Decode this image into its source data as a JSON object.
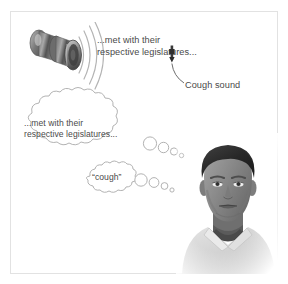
{
  "figure": {
    "background_color": "#ffffff",
    "frame_color": "#e2e2e2",
    "text_color": "#4a4a4a",
    "outline_color": "#b0b0b0"
  },
  "speaker_icon": {
    "name": "loudspeaker-icon",
    "wave_count": 4,
    "body_color": "#7a7a7a",
    "highlight_color": "#cfcfcf",
    "shadow_color": "#4f4f4f"
  },
  "spoken_text": {
    "line1": "...met with their",
    "line2": "respective legislatures..."
  },
  "cough_marker": {
    "label": "Cough sound",
    "marker_color": "#3a3a3a"
  },
  "thought_bubbles": [
    {
      "id": "bubble-speech-thought",
      "line1": "...met with their",
      "line2": "respective legislatures...",
      "tail_circle_count": 4
    },
    {
      "id": "bubble-cough-thought",
      "line1": "“cough”",
      "line2": "",
      "tail_circle_count": 4
    }
  ],
  "portrait": {
    "name": "listener-portrait",
    "description": "Grayscale photo of a man in a light collared shirt",
    "skin_tone": "#8d8d8d",
    "shirt_color": "#d9d9d9",
    "hair_color": "#2b2b2b"
  }
}
